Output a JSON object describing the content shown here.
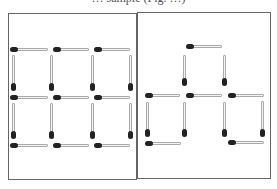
{
  "caption": "… sample (Fig. …)",
  "colors": {
    "match_head": "#222222",
    "match_stick": "#f4f4f4",
    "frame": "#666666"
  },
  "panels": [
    {
      "name": "left-panel",
      "description": "Six squares (3x2 grid) made of 17 matches",
      "box": [
        8,
        13,
        129,
        167
      ],
      "matches": [
        {
          "o": "h",
          "x": 11,
          "y": 48,
          "l": 37
        },
        {
          "o": "h",
          "x": 54,
          "y": 48,
          "l": 35
        },
        {
          "o": "h",
          "x": 95,
          "y": 48,
          "l": 35
        },
        {
          "o": "v",
          "x": 12,
          "y": 55,
          "l": 35
        },
        {
          "o": "v",
          "x": 50,
          "y": 55,
          "l": 35
        },
        {
          "o": "v",
          "x": 91,
          "y": 55,
          "l": 35
        },
        {
          "o": "v",
          "x": 129,
          "y": 55,
          "l": 35
        },
        {
          "o": "h",
          "x": 11,
          "y": 96,
          "l": 37
        },
        {
          "o": "h",
          "x": 54,
          "y": 96,
          "l": 35
        },
        {
          "o": "h",
          "x": 95,
          "y": 96,
          "l": 35
        },
        {
          "o": "v",
          "x": 12,
          "y": 103,
          "l": 35
        },
        {
          "o": "v",
          "x": 50,
          "y": 103,
          "l": 35
        },
        {
          "o": "v",
          "x": 91,
          "y": 103,
          "l": 35
        },
        {
          "o": "v",
          "x": 129,
          "y": 103,
          "l": 35
        },
        {
          "o": "h",
          "x": 11,
          "y": 144,
          "l": 37
        },
        {
          "o": "h",
          "x": 54,
          "y": 144,
          "l": 35
        },
        {
          "o": "h",
          "x": 95,
          "y": 144,
          "l": 35
        }
      ]
    },
    {
      "name": "right-panel",
      "description": "Rearranged matchstick figure",
      "box": [
        137,
        12,
        134,
        167
      ],
      "matches": [
        {
          "o": "h",
          "x": 187,
          "y": 45,
          "l": 35
        },
        {
          "o": "v",
          "x": 183,
          "y": 55,
          "l": 30
        },
        {
          "o": "v",
          "x": 223,
          "y": 55,
          "l": 30
        },
        {
          "o": "h",
          "x": 146,
          "y": 94,
          "l": 34
        },
        {
          "o": "h",
          "x": 187,
          "y": 94,
          "l": 35
        },
        {
          "o": "h",
          "x": 229,
          "y": 94,
          "l": 35
        },
        {
          "o": "v",
          "x": 146,
          "y": 102,
          "l": 34
        },
        {
          "o": "v",
          "x": 183,
          "y": 102,
          "l": 34
        },
        {
          "o": "v",
          "x": 223,
          "y": 102,
          "l": 34
        },
        {
          "o": "v",
          "x": 261,
          "y": 101,
          "l": 35
        },
        {
          "o": "h",
          "x": 146,
          "y": 142,
          "l": 35
        },
        {
          "o": "h",
          "x": 229,
          "y": 141,
          "l": 35
        }
      ]
    }
  ]
}
